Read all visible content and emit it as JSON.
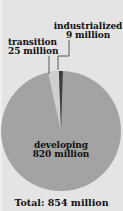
{
  "chart_data": {
    "type": "pie",
    "title": "",
    "total_label": "Total: 854 million",
    "unit": "million",
    "slices": [
      {
        "name": "developing",
        "value": 820,
        "value_label": "820 million",
        "color": "#a3a3a3"
      },
      {
        "name": "transition",
        "value": 25,
        "value_label": "25 million",
        "color": "#cfcfcf"
      },
      {
        "name": "industrialized",
        "value": 9,
        "value_label": "9 million",
        "color": "#3c3c3c"
      }
    ],
    "categories": [
      "developing",
      "transition",
      "industrialized"
    ],
    "values": [
      820,
      25,
      9
    ],
    "total": 854,
    "legend": "none (direct labels)",
    "background_color": "#e4e4e4"
  },
  "labels": {
    "industrialized": {
      "name": "industrialized",
      "value": "9 million"
    },
    "transition": {
      "name": "transition",
      "value": "25 million"
    },
    "developing": {
      "name": "developing",
      "value": "820 million"
    },
    "total": "Total: 854 million"
  }
}
